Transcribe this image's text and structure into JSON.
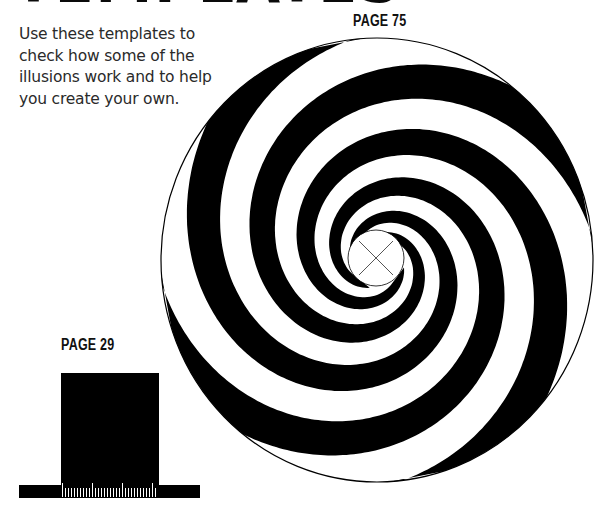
{
  "page": {
    "title": "TEMPLATES",
    "intro_lines": [
      "Use these templates to",
      "check how some of the",
      "illusions work and to help",
      "you create your own."
    ]
  },
  "templates": [
    {
      "label": "PAGE 75",
      "figure": "spiral-illusion",
      "description": "black and white multi-arm spiral disc with center cross mark"
    },
    {
      "label": "PAGE 29",
      "figure": "block-on-ruler",
      "description": "black rectangle standing on a base bar with tick scale"
    }
  ],
  "spiral": {
    "cx": 377,
    "cy": 260,
    "rx": 216,
    "ry": 222,
    "arms": 4,
    "turns": 3.2,
    "inner_r": 28,
    "twist": 1.0,
    "center_mark": "x-cross"
  },
  "colors": {
    "ink": "#000000",
    "paper": "#ffffff",
    "text": "#2a2a2a"
  }
}
